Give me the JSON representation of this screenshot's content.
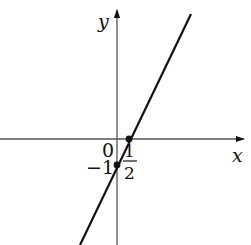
{
  "figure": {
    "type": "linear-function-graph",
    "equation_implied": "y = 2x - 1",
    "axes": {
      "x_label": "x",
      "y_label": "y",
      "origin_label": "0"
    },
    "points": [
      {
        "name": "x-intercept",
        "x": 0.5,
        "y": 0,
        "label": "1/2",
        "label_num": "1",
        "label_den": "2"
      },
      {
        "name": "y-intercept",
        "x": 0,
        "y": -1,
        "label": "−1"
      }
    ],
    "colors": {
      "axis": "#555555",
      "line": "#111111",
      "text": "#111111"
    }
  }
}
